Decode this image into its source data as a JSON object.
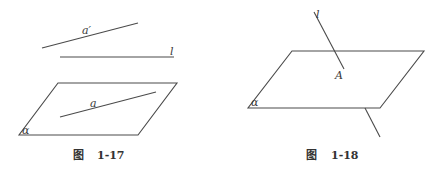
{
  "figures": [
    {
      "caption_prefix": "图",
      "caption_number": "1-17",
      "labels": {
        "line_a_prime": "a′",
        "line_l": "l",
        "line_a": "a",
        "plane": "α"
      },
      "description": "Line a lies in plane α; lines a′ and l are outside the plane"
    },
    {
      "caption_prefix": "图",
      "caption_number": "1-18",
      "labels": {
        "line_l": "l",
        "point": "A",
        "plane": "α"
      },
      "description": "Line l intersects plane α at point A"
    }
  ],
  "colors": {
    "stroke": "#4a4a4a",
    "text": "#3a3a3a",
    "background": "#ffffff"
  }
}
